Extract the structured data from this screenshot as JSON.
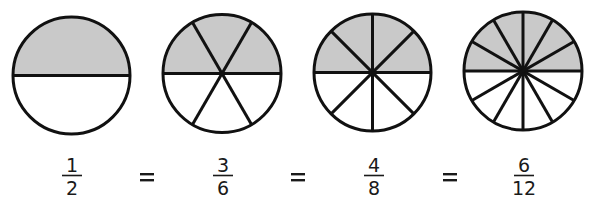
{
  "colors": {
    "shaded": "#c9c9c9",
    "unshaded": "#ffffff",
    "stroke": "#111111"
  },
  "circles": [
    {
      "cx": 71.5,
      "cy": 75.5,
      "r": 58.5,
      "parts": 2,
      "shaded": 1
    },
    {
      "cx": 222,
      "cy": 73.5,
      "r": 59,
      "parts": 6,
      "shaded": 3
    },
    {
      "cx": 372.5,
      "cy": 72.5,
      "r": 58.5,
      "parts": 8,
      "shaded": 4
    },
    {
      "cx": 523,
      "cy": 71,
      "r": 59,
      "parts": 12,
      "shaded": 6
    }
  ],
  "fractions": [
    {
      "numerator": "1",
      "denominator": "2",
      "x": 72
    },
    {
      "numerator": "3",
      "denominator": "6",
      "x": 223
    },
    {
      "numerator": "4",
      "denominator": "8",
      "x": 374
    },
    {
      "numerator": "6",
      "denominator": "12",
      "x": 524
    }
  ],
  "equals": [
    {
      "symbol": "=",
      "x": 147
    },
    {
      "symbol": "=",
      "x": 298
    },
    {
      "symbol": "=",
      "x": 450
    }
  ]
}
